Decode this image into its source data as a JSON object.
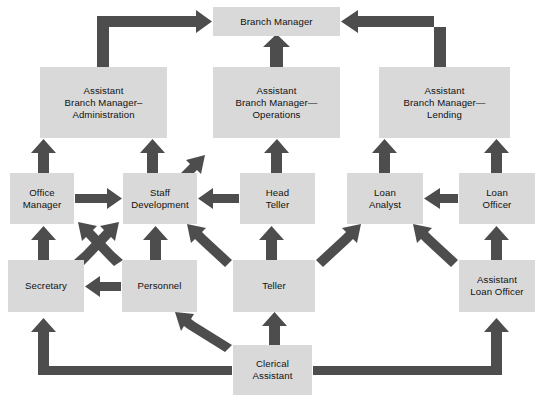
{
  "diagram": {
    "colors": {
      "background": "#ffffff",
      "box_fill": "#d9d9d9",
      "arrow": "#4d4d4d",
      "text": "#111111"
    },
    "nodes": [
      {
        "id": "branch-manager",
        "label": "Branch Manager",
        "x": 213,
        "y": 7,
        "w": 127,
        "h": 29
      },
      {
        "id": "abm-administration",
        "label": "Assistant\nBranch Manager–\nAdministration",
        "x": 40,
        "y": 67,
        "w": 127,
        "h": 71
      },
      {
        "id": "abm-operations",
        "label": "Assistant\nBranch Manager—\nOperations",
        "x": 213,
        "y": 67,
        "w": 127,
        "h": 71
      },
      {
        "id": "abm-lending",
        "label": "Assistant\nBranch Manager—\nLending",
        "x": 379,
        "y": 67,
        "w": 131,
        "h": 71
      },
      {
        "id": "office-manager",
        "label": "Office\nManager",
        "x": 10,
        "y": 173,
        "w": 64,
        "h": 51
      },
      {
        "id": "staff-development",
        "label": "Staff\nDevelopment",
        "x": 123,
        "y": 173,
        "w": 74,
        "h": 51
      },
      {
        "id": "head-teller",
        "label": "Head\nTeller",
        "x": 240,
        "y": 173,
        "w": 75,
        "h": 51
      },
      {
        "id": "loan-analyst",
        "label": "Loan\nAnalyst",
        "x": 347,
        "y": 173,
        "w": 76,
        "h": 51
      },
      {
        "id": "loan-officer",
        "label": "Loan\nOfficer",
        "x": 459,
        "y": 173,
        "w": 76,
        "h": 51
      },
      {
        "id": "secretary",
        "label": "Secretary",
        "x": 8,
        "y": 260,
        "w": 76,
        "h": 52
      },
      {
        "id": "personnel",
        "label": "Personnel",
        "x": 122,
        "y": 260,
        "w": 75,
        "h": 52
      },
      {
        "id": "teller",
        "label": "Teller",
        "x": 233,
        "y": 260,
        "w": 82,
        "h": 52
      },
      {
        "id": "assistant-loan-officer",
        "label": "Assistant\nLoan Officer",
        "x": 459,
        "y": 260,
        "w": 76,
        "h": 52
      },
      {
        "id": "clerical-assistant",
        "label": "Clerical\nAssistant",
        "x": 233,
        "y": 345,
        "w": 79,
        "h": 50
      }
    ],
    "edges": [
      {
        "id": "admin-to-manager",
        "from": "abm-administration",
        "to": "branch-manager",
        "style": "elbow-up-right"
      },
      {
        "id": "operations-to-manager",
        "from": "abm-operations",
        "to": "branch-manager",
        "style": "straight-up"
      },
      {
        "id": "lending-to-manager",
        "from": "abm-lending",
        "to": "branch-manager",
        "style": "elbow-up-left"
      },
      {
        "id": "office-manager-to-admin",
        "from": "office-manager",
        "to": "abm-administration",
        "style": "straight-up"
      },
      {
        "id": "staff-development-to-admin",
        "from": "staff-development",
        "to": "abm-administration",
        "style": "straight-up"
      },
      {
        "id": "staff-development-to-operations",
        "from": "staff-development",
        "to": "abm-operations",
        "style": "diagonal-up-right"
      },
      {
        "id": "head-teller-to-operations",
        "from": "head-teller",
        "to": "abm-operations",
        "style": "straight-up"
      },
      {
        "id": "loan-analyst-to-lending",
        "from": "loan-analyst",
        "to": "abm-lending",
        "style": "straight-up"
      },
      {
        "id": "loan-officer-to-lending",
        "from": "loan-officer",
        "to": "abm-lending",
        "style": "straight-up"
      },
      {
        "id": "office-manager-to-staff-development",
        "from": "office-manager",
        "to": "staff-development",
        "style": "straight-right"
      },
      {
        "id": "head-teller-to-staff-development",
        "from": "head-teller",
        "to": "staff-development",
        "style": "straight-left"
      },
      {
        "id": "loan-officer-to-loan-analyst",
        "from": "loan-officer",
        "to": "loan-analyst",
        "style": "straight-left"
      },
      {
        "id": "secretary-to-office-manager",
        "from": "secretary",
        "to": "office-manager",
        "style": "straight-up"
      },
      {
        "id": "secretary-to-staff-development",
        "from": "secretary",
        "to": "staff-development",
        "style": "diagonal-up-right"
      },
      {
        "id": "personnel-to-office-manager",
        "from": "personnel",
        "to": "office-manager",
        "style": "diagonal-up-left"
      },
      {
        "id": "personnel-to-staff-development",
        "from": "personnel",
        "to": "staff-development",
        "style": "straight-up"
      },
      {
        "id": "personnel-to-secretary",
        "from": "personnel",
        "to": "secretary",
        "style": "straight-left"
      },
      {
        "id": "teller-to-staff-development",
        "from": "teller",
        "to": "staff-development",
        "style": "diagonal-up-left"
      },
      {
        "id": "teller-to-head-teller",
        "from": "teller",
        "to": "head-teller",
        "style": "straight-up"
      },
      {
        "id": "teller-to-loan-analyst",
        "from": "teller",
        "to": "loan-analyst",
        "style": "diagonal-up-right"
      },
      {
        "id": "assistant-loan-officer-to-loan-analyst",
        "from": "assistant-loan-officer",
        "to": "loan-analyst",
        "style": "diagonal-up-left"
      },
      {
        "id": "assistant-loan-officer-to-loan-officer",
        "from": "assistant-loan-officer",
        "to": "loan-officer",
        "style": "straight-up"
      },
      {
        "id": "clerical-assistant-to-teller",
        "from": "clerical-assistant",
        "to": "teller",
        "style": "straight-up"
      },
      {
        "id": "clerical-assistant-to-personnel",
        "from": "clerical-assistant",
        "to": "personnel",
        "style": "diagonal-up-left"
      },
      {
        "id": "clerical-assistant-to-secretary",
        "from": "clerical-assistant",
        "to": "secretary",
        "style": "elbow-left-up"
      },
      {
        "id": "clerical-assistant-to-assistant-loan-officer",
        "from": "clerical-assistant",
        "to": "assistant-loan-officer",
        "style": "elbow-right-up"
      }
    ]
  }
}
